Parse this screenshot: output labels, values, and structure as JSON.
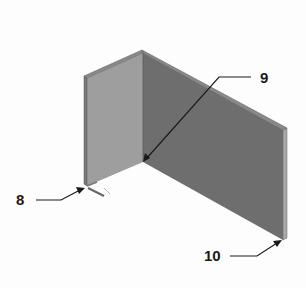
{
  "figure": {
    "colors": {
      "left_panel": "#9e9e9e",
      "right_panel": "#6e6e6e",
      "top_edge": "#8a8a8a",
      "edge_dark": "#555555",
      "right_edge": "#a8a8a8",
      "leader": "#1a1a1a"
    }
  },
  "callouts": [
    {
      "id": "8",
      "label": "8"
    },
    {
      "id": "9",
      "label": "9"
    },
    {
      "id": "10",
      "label": "10"
    }
  ]
}
